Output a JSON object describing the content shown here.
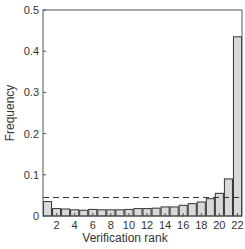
{
  "chart_data": {
    "type": "bar",
    "title": "",
    "xlabel": "Verification rank",
    "ylabel": "Frequency",
    "ylim": [
      0,
      0.5
    ],
    "yticks": [
      0,
      0.1,
      0.2,
      0.3,
      0.4,
      0.5
    ],
    "ytick_labels": [
      "0",
      "0.1",
      "0.2",
      "0.3",
      "0.4",
      "0.5"
    ],
    "xticks": [
      2,
      4,
      6,
      8,
      10,
      12,
      14,
      16,
      18,
      20,
      22
    ],
    "categories": [
      1,
      2,
      3,
      4,
      5,
      6,
      7,
      8,
      9,
      10,
      11,
      12,
      13,
      14,
      15,
      16,
      17,
      18,
      19,
      20,
      21,
      22
    ],
    "values": [
      0.035,
      0.018,
      0.017,
      0.015,
      0.014,
      0.016,
      0.015,
      0.015,
      0.015,
      0.016,
      0.018,
      0.018,
      0.019,
      0.022,
      0.022,
      0.026,
      0.03,
      0.034,
      0.042,
      0.055,
      0.09,
      0.435
    ],
    "reference_line": {
      "y": 0.045,
      "style": "dashed"
    },
    "grid": false,
    "bar_color": "#d9d9d9",
    "edge_color": "#333333"
  }
}
